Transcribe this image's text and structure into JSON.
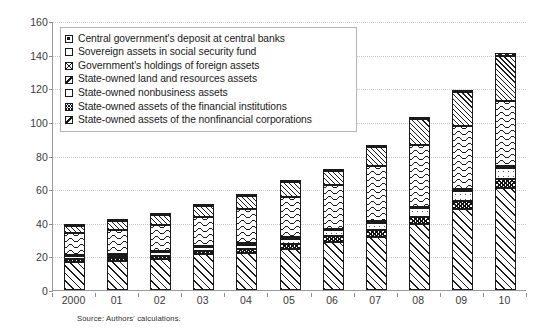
{
  "chart_data": {
    "type": "bar",
    "stacked": true,
    "title": "",
    "subtitle": "",
    "xlabel": "",
    "ylabel": "",
    "ylim": [
      0,
      160
    ],
    "ytick_step": 20,
    "yticks": [
      0,
      20,
      40,
      60,
      80,
      100,
      120,
      140,
      160
    ],
    "grid": true,
    "grid_style": "horizontal dotted gridlines",
    "legend_position": "upper left inside plot area",
    "categories": [
      "2000",
      "01",
      "02",
      "03",
      "04",
      "05",
      "06",
      "07",
      "08",
      "09",
      "10"
    ],
    "series": [
      {
        "name": "State-owned assets of the nonfinancial corporations",
        "pattern": "diagonal-hatch",
        "legend_index": 6,
        "stack_order": 0,
        "values": [
          16.5,
          17.0,
          18.5,
          21.5,
          22.0,
          24.5,
          28.5,
          31.5,
          39.0,
          48.0,
          60.5
        ]
      },
      {
        "name": "State-owned assets of the financial institutions",
        "pattern": "dense-crosshatch",
        "legend_index": 5,
        "stack_order": 1,
        "values": [
          2.0,
          2.0,
          2.0,
          2.0,
          2.5,
          3.0,
          3.5,
          4.0,
          4.5,
          5.0,
          5.5
        ]
      },
      {
        "name": "State-owned nonbusiness assets",
        "pattern": "sparse-dots",
        "legend_index": 4,
        "stack_order": 2,
        "values": [
          1.5,
          1.5,
          2.0,
          2.0,
          2.5,
          3.0,
          3.5,
          4.5,
          5.0,
          6.0,
          6.5
        ]
      },
      {
        "name": "State-owned land and resources assets",
        "pattern": "fine-grid",
        "legend_index": 3,
        "stack_order": 3,
        "values": [
          0.8,
          0.8,
          0.8,
          0.8,
          0.8,
          0.8,
          1.0,
          1.0,
          1.0,
          1.0,
          1.2
        ]
      },
      {
        "name": "Government's holdings of foreign assets",
        "pattern": "wavy-lines",
        "legend_index": 2,
        "stack_order": 4,
        "values": [
          13.0,
          14.5,
          15.5,
          17.0,
          20.5,
          24.0,
          26.0,
          33.0,
          37.0,
          37.5,
          39.0
        ]
      },
      {
        "name": "Sovereign assets in social security fund",
        "pattern": "fine-diagonal-hatch",
        "legend_index": 1,
        "stack_order": 5,
        "values": [
          4.5,
          5.5,
          6.0,
          6.5,
          7.5,
          9.0,
          8.5,
          11.0,
          15.0,
          20.0,
          26.5
        ]
      },
      {
        "name": "Central government's deposit at central banks",
        "pattern": "small-dark-squares",
        "legend_index": 0,
        "stack_order": 6,
        "values": [
          0.7,
          0.7,
          0.7,
          0.7,
          0.7,
          0.7,
          1.0,
          1.0,
          1.5,
          1.5,
          2.0
        ]
      }
    ],
    "totals": [
      39.0,
      42.0,
      45.5,
      50.5,
      56.5,
      65.0,
      72.0,
      86.0,
      103.0,
      119.0,
      141.2
    ]
  },
  "legend": {
    "items": [
      {
        "label": "Central government's deposit at central banks",
        "swatch": "sw-deposit"
      },
      {
        "label": "Sovereign assets in social security fund",
        "swatch": "sw-sovereign"
      },
      {
        "label": "Government's holdings of foreign assets",
        "swatch": "sw-foreign"
      },
      {
        "label": "State-owned land and resources assets",
        "swatch": "sw-land"
      },
      {
        "label": "State-owned nonbusiness assets",
        "swatch": "sw-nonbus"
      },
      {
        "label": "State-owned assets of the financial institutions",
        "swatch": "sw-fin"
      },
      {
        "label": "State-owned assets of the nonfinancial corporations",
        "swatch": "sw-nonfin"
      }
    ]
  },
  "source_note": "Source: Authors' calculations.",
  "colors": {
    "background": "#ffffff",
    "ink": "#1a1a1a",
    "axis": "#8d8d8d",
    "gridline": "#c8c8c8",
    "legend_border": "#b4b4b4",
    "tick_label": "#3a3a3a"
  }
}
